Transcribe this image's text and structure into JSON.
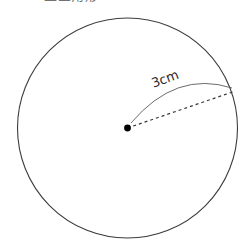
{
  "figure": {
    "background_color": "#ffffff",
    "stroke_color": "#3c3c3c",
    "dash_color": "#3a3a3a",
    "title_text": "正三角形",
    "circle": {
      "center_x": 127.5,
      "center_y": 128.0,
      "radius_px": 110.0,
      "stroke_width": 1.1
    },
    "center_point": {
      "label": "center-dot",
      "x": 127.5,
      "y": 128.0,
      "radius_px": 3.4,
      "fill": "#000000"
    },
    "radius_line": {
      "style": "dashed",
      "from_x": 127.5,
      "from_y": 128.0,
      "to_x": 232.5,
      "to_y": 92.0,
      "dash_pattern": "3 3",
      "stroke_width": 1.2
    },
    "leader_arc": {
      "style": "solid-curved",
      "from_x": 131.0,
      "from_y": 123.0,
      "control_x": 176.0,
      "control_y": 70.0,
      "to_x": 232.0,
      "to_y": 88.0,
      "stroke_width": 0.9
    },
    "measure_label": {
      "text": "3cm",
      "rotation_deg": -20,
      "x": 152,
      "y": 76
    }
  }
}
